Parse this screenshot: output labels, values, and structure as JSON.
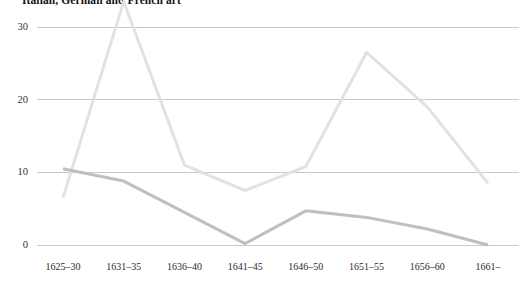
{
  "chart_data": {
    "type": "line",
    "title": "Italian, German and French art",
    "xlabel": "",
    "ylabel": "",
    "categories": [
      "1625–30",
      "1631–35",
      "1636–40",
      "1641–45",
      "1646–50",
      "1651–55",
      "1656–60",
      "1661–"
    ],
    "ylim": [
      0,
      33.5
    ],
    "yticks": [
      0,
      10,
      20,
      30
    ],
    "ytick_labels": [
      "0",
      "10",
      "20",
      "30"
    ],
    "grid": true,
    "legend": "none",
    "series": [
      {
        "name": "series-light",
        "color": "#e2e2e2",
        "values": [
          6.5,
          33.5,
          11.0,
          7.5,
          10.8,
          26.5,
          19.0,
          8.5
        ]
      },
      {
        "name": "series-dark",
        "color": "#bfbfbf",
        "values": [
          10.5,
          8.8,
          4.5,
          0.2,
          4.7,
          3.8,
          2.2,
          0.0
        ]
      }
    ]
  },
  "axes": {
    "y_ticks": [
      "0",
      "10",
      "20",
      "30"
    ],
    "x_ticks": [
      "1625–30",
      "1631–35",
      "1636–40",
      "1641–45",
      "1646–50",
      "1651–55",
      "1656–60",
      "1661–"
    ]
  },
  "colors": {
    "background": "#ffffff",
    "gridline": "#c9c9c9",
    "series_light": "#e2e2e2",
    "series_dark": "#bfbfbf",
    "text": "#1a1a1a"
  }
}
